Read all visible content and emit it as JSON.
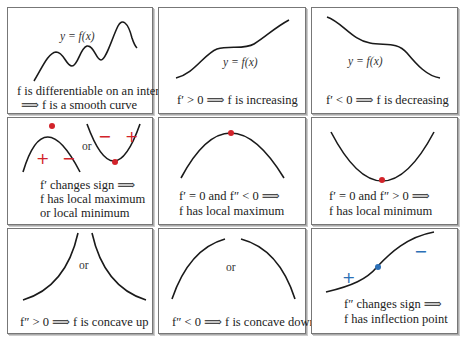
{
  "colors": {
    "curve": "#1a1a1a",
    "critical_point": "#d2232a",
    "inflection_point": "#2b6fb6",
    "border": "#777777"
  },
  "panels": [
    {
      "id": "smooth",
      "label": "y = f(x)",
      "caption": [
        "f is differentiable on an interval",
        "⟹ f is a smooth curve"
      ]
    },
    {
      "id": "increasing",
      "label": "y = f(x)",
      "caption": [
        "f′ > 0 ⟹ f is increasing"
      ]
    },
    {
      "id": "decreasing",
      "label": "y = f(x)",
      "caption": [
        "f′ < 0 ⟹ f is decreasing"
      ]
    },
    {
      "id": "sign-change",
      "or": "or",
      "signs": [
        "+",
        "−",
        "−",
        "+"
      ],
      "caption": [
        "f′ changes sign ⟹",
        "f has local maximum",
        "or local minimum"
      ]
    },
    {
      "id": "local-max",
      "caption": [
        "f′ = 0 and f″ < 0 ⟹",
        "f has local maximum"
      ]
    },
    {
      "id": "local-min",
      "caption": [
        "f′ = 0 and f″ > 0 ⟹",
        "f has local minimum"
      ]
    },
    {
      "id": "concave-up",
      "or": "or",
      "caption": [
        "f″ > 0 ⟹ f is concave up"
      ]
    },
    {
      "id": "concave-down",
      "or": "or",
      "caption": [
        "f″ < 0 ⟹ f is concave down"
      ]
    },
    {
      "id": "inflection",
      "signs": [
        "+",
        "−"
      ],
      "caption": [
        "f″ changes sign ⟹",
        "f has inflection point"
      ]
    }
  ]
}
